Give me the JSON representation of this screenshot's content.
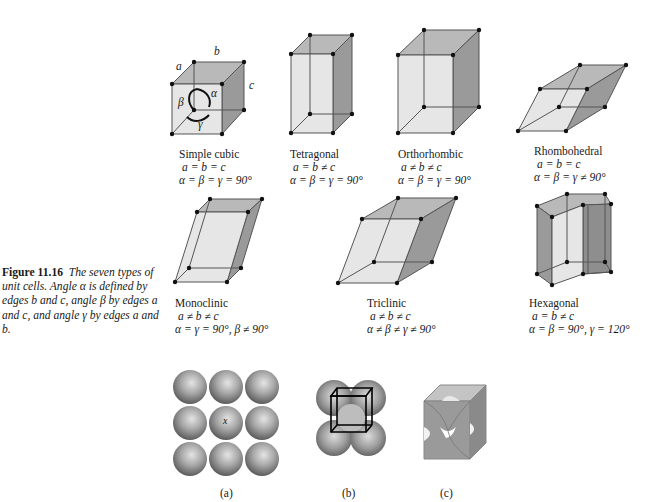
{
  "caption": {
    "figure_number": "Figure 11.16",
    "text": "The seven types of unit cells. Angle α is defined by edges b and c, angle β by edges a and c, and angle γ by edges a and b."
  },
  "unit_cells": [
    {
      "name": "Simple cubic",
      "edges": "a = b = c",
      "angles": "α = β = γ = 90°",
      "edge_labels": {
        "a": "a",
        "b": "b",
        "c": "c"
      },
      "angle_labels": {
        "alpha": "α",
        "beta": "β",
        "gamma": "γ"
      }
    },
    {
      "name": "Tetragonal",
      "edges": "a = b ≠ c",
      "angles": "α = β = γ = 90°"
    },
    {
      "name": "Orthorhombic",
      "edges": "a ≠ b ≠ c",
      "angles": "α = β = γ = 90°"
    },
    {
      "name": "Rhombohedral",
      "edges": "a = b = c",
      "angles": "α = β = γ ≠ 90°"
    },
    {
      "name": "Monoclinic",
      "edges": "a ≠ b ≠ c",
      "angles": "α = γ = 90°, β ≠ 90°"
    },
    {
      "name": "Triclinic",
      "edges": "a ≠ b ≠ c",
      "angles": "α ≠ β ≠ γ ≠ 90°"
    },
    {
      "name": "Hexagonal",
      "edges": "a = b ≠ c",
      "angles": "α = β = 90°, γ = 120°"
    }
  ],
  "packing_figures": {
    "a": {
      "label": "(a)",
      "center_marker": "x"
    },
    "b": {
      "label": "(b)"
    },
    "c": {
      "label": "(c)"
    }
  },
  "colors": {
    "front_face": "#e6e6e6",
    "top_face": "#b9b9b9",
    "side_face": "#9a9a9a",
    "edge": "#555555",
    "vertex": "#111111"
  }
}
